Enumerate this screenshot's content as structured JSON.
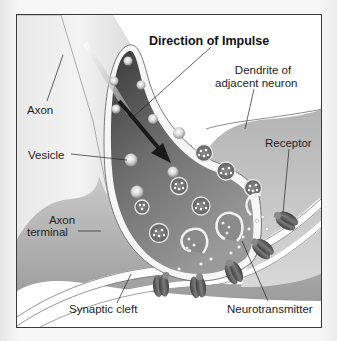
{
  "diagram": {
    "title": "Direction of Impulse",
    "labels": {
      "axon": "Axon",
      "vesicle": "Vesicle",
      "axon_terminal_line1": "Axon",
      "axon_terminal_line2": "terminal",
      "synaptic_cleft": "Synaptic cleft",
      "dendrite_line1": "Dendrite of",
      "dendrite_line2": "adjacent neuron",
      "receptor": "Receptor",
      "neurotransmitter": "Neurotransmitter"
    },
    "colors": {
      "frame_border": "#3a3a3a",
      "terminal_dark": "#4a4a4a",
      "terminal_mid": "#8c8c8c",
      "membrane_light": "#f4f4f4",
      "dendrite_gray": "#9e9e9e",
      "receptor": "#5a5a5a",
      "arrow": "#1a1a1a"
    }
  }
}
